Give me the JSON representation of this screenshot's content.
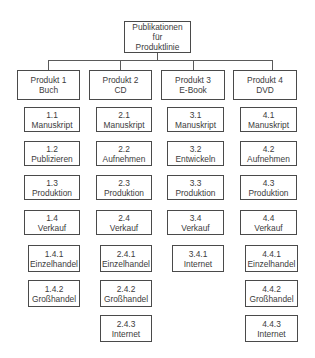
{
  "diagram": {
    "type": "work-breakdown-structure",
    "root": {
      "id": "root",
      "lines": [
        "Publikationen",
        "für",
        "Produktlinie"
      ]
    },
    "products": [
      {
        "id": "p1",
        "lines": [
          "Produkt 1",
          "Buch"
        ],
        "tasks": [
          {
            "num": "1.1",
            "label": "Manuskript"
          },
          {
            "num": "1.2",
            "label": "Publizieren"
          },
          {
            "num": "1.3",
            "label": "Produktion"
          },
          {
            "num": "1.4",
            "label": "Verkauf"
          }
        ],
        "subtasks": [
          {
            "num": "1.4.1",
            "label": "Einzelhandel"
          },
          {
            "num": "1.4.2",
            "label": "Großhandel"
          }
        ]
      },
      {
        "id": "p2",
        "lines": [
          "Produkt 2",
          "CD"
        ],
        "tasks": [
          {
            "num": "2.1",
            "label": "Manuskript"
          },
          {
            "num": "2.2",
            "label": "Aufnehmen"
          },
          {
            "num": "2.3",
            "label": "Produktion"
          },
          {
            "num": "2.4",
            "label": "Verkauf"
          }
        ],
        "subtasks": [
          {
            "num": "2.4.1",
            "label": "Einzelhandel"
          },
          {
            "num": "2.4.2",
            "label": "Großhandel"
          },
          {
            "num": "2.4.3",
            "label": "Internet"
          }
        ]
      },
      {
        "id": "p3",
        "lines": [
          "Produkt 3",
          "E-Book"
        ],
        "tasks": [
          {
            "num": "3.1",
            "label": "Manuskript"
          },
          {
            "num": "3.2",
            "label": "Entwickeln"
          },
          {
            "num": "3.3",
            "label": "Produktion"
          },
          {
            "num": "3.4",
            "label": "Verkauf"
          }
        ],
        "subtasks": [
          {
            "num": "3.4.1",
            "label": "Internet"
          }
        ]
      },
      {
        "id": "p4",
        "lines": [
          "Produkt 4",
          "DVD"
        ],
        "tasks": [
          {
            "num": "4.1",
            "label": "Manuskript"
          },
          {
            "num": "4.2",
            "label": "Aufnehmen"
          },
          {
            "num": "4.3",
            "label": "Produktion"
          },
          {
            "num": "4.4",
            "label": "Verkauf"
          }
        ],
        "subtasks": [
          {
            "num": "4.4.1",
            "label": "Einzelhandel"
          },
          {
            "num": "4.4.2",
            "label": "Großhandel"
          },
          {
            "num": "4.4.3",
            "label": "Internet"
          }
        ]
      }
    ]
  },
  "colors": {
    "border": "#4a4a4a",
    "text": "#3c3c3c",
    "background": "#ffffff"
  }
}
